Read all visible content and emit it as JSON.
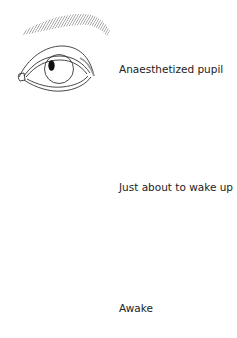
{
  "diagram": {
    "type": "pupil-stages-flow",
    "colors": {
      "line": "#333333",
      "pupil": "#111111",
      "hatch": "#777777",
      "text": "#222222"
    },
    "stages": [
      {
        "label": "Anaesthetized pupil",
        "pupil_shape": "small-oval",
        "pupil_size": "small"
      },
      {
        "label": "Just about to wake up",
        "pupil_shape": "circle",
        "pupil_size": "large"
      },
      {
        "label": "Awake",
        "pupil_shape": "circle",
        "pupil_size": "medium"
      }
    ],
    "arrows": [
      {
        "from": 0,
        "to": 1,
        "direction": "down"
      },
      {
        "from": 1,
        "to": 2,
        "direction": "down"
      }
    ]
  }
}
